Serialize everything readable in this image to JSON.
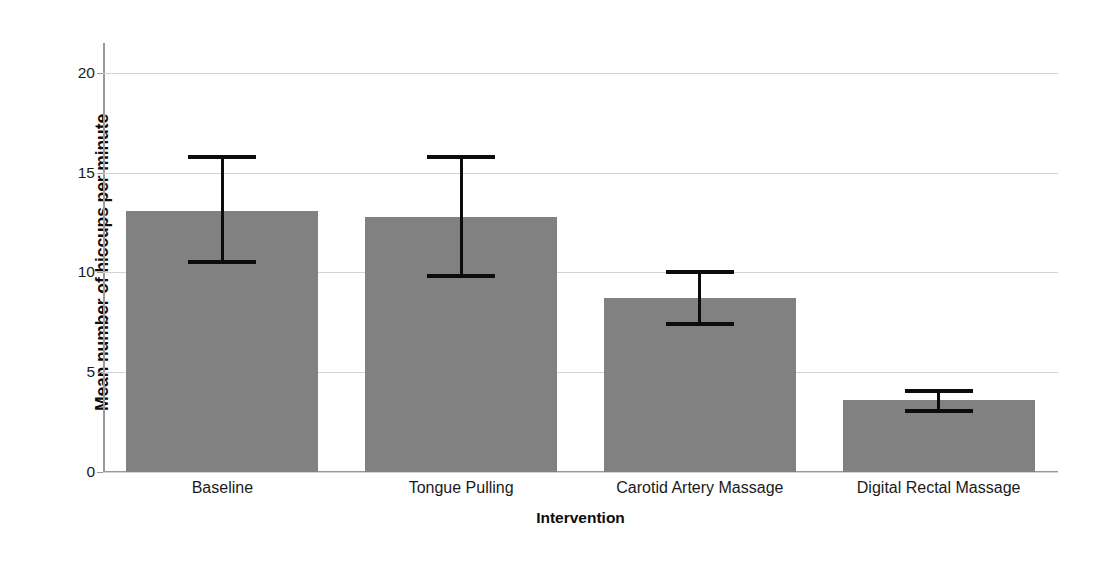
{
  "chart_data": {
    "type": "bar",
    "title": "",
    "xlabel": "Intervention",
    "ylabel": "Mean number of hiccups per minute",
    "categories": [
      "Baseline",
      "Tongue Pulling",
      "Carotid Artery Massage",
      "Digital Rectal Massage"
    ],
    "values": [
      13.1,
      12.8,
      8.7,
      3.6
    ],
    "error_bars": {
      "type": "95% CI",
      "upper": [
        15.8,
        15.8,
        10.0,
        4.05
      ],
      "lower": [
        10.5,
        9.8,
        7.4,
        3.05
      ]
    },
    "ylim": [
      0,
      21.5
    ],
    "yticks": [
      0,
      5,
      10,
      15,
      20
    ],
    "ytick_labels": [
      "0",
      "5",
      "10",
      "15",
      "20"
    ],
    "grid": "horizontal",
    "legend": "none",
    "bar_color": "#818181",
    "error_bar_color": "#0c0c0c",
    "gridline_color": "#d2d2d2",
    "axis_color": "#9a9a9a",
    "background_color": "#ffffff"
  }
}
